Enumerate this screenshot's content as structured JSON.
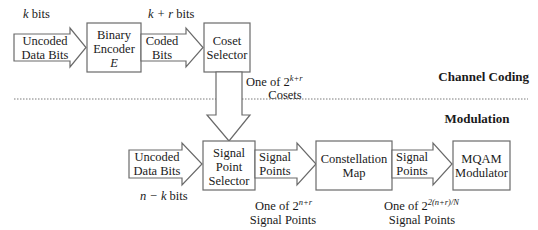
{
  "diagram": {
    "sections": {
      "upper": "Channel Coding",
      "lower": "Modulation"
    },
    "blocks": {
      "binary_encoder": {
        "line1": "Binary",
        "line2": "Encoder",
        "line3": "E"
      },
      "coset_selector": {
        "line1": "Coset",
        "line2": "Selector"
      },
      "signal_point_selector": {
        "line1": "Signal",
        "line2": "Point",
        "line3": "Selector"
      },
      "constellation_map": {
        "line1": "Constellation",
        "line2": "Map"
      },
      "mqam_modulator": {
        "line1": "MQAM",
        "line2": "Modulator"
      }
    },
    "arrows": {
      "uncoded_top": {
        "line1": "Uncoded",
        "line2": "Data Bits",
        "label_var": "k",
        "label_rest": " bits"
      },
      "coded": {
        "line1": "Coded",
        "line2": "Bits",
        "label_var": "k + r",
        "label_rest": " bits"
      },
      "cosets": {
        "line1_prefix": "One of 2",
        "line1_exp": "k+r",
        "line2": "Cosets"
      },
      "uncoded_bottom": {
        "line1": "Uncoded",
        "line2": "Data Bits",
        "label_var": "n − k",
        "label_rest": " bits"
      },
      "signal_points_1": {
        "line1": "Signal",
        "line2": "Points",
        "note_prefix": "One of 2",
        "note_exp": "n+r",
        "note_line2": "Signal Points"
      },
      "signal_points_2": {
        "line1": "Signal",
        "line2": "Points",
        "note_prefix": "One of 2",
        "note_exp": "2(n+r)/N",
        "note_line2": "Signal Points"
      }
    }
  }
}
